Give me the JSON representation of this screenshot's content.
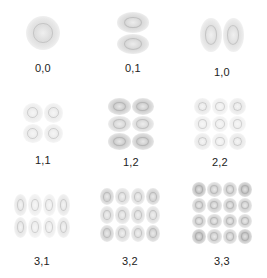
{
  "figure": {
    "panels": [
      {
        "label": "0,0",
        "nx": 1,
        "ny": 1,
        "cx": 43,
        "cy": 33,
        "w": 34,
        "h": 34,
        "intensity": 0.3
      },
      {
        "label": "0,1",
        "nx": 1,
        "ny": 2,
        "cx": 133,
        "cy": 33,
        "w": 32,
        "h": 42,
        "intensity": 0.35
      },
      {
        "label": "1,0",
        "nx": 2,
        "ny": 1,
        "cx": 222,
        "cy": 35,
        "w": 44,
        "h": 34,
        "intensity": 0.28
      },
      {
        "label": "1,1",
        "nx": 2,
        "ny": 2,
        "cx": 43,
        "cy": 123,
        "w": 40,
        "h": 40,
        "intensity": 0.18
      },
      {
        "label": "1,2",
        "nx": 2,
        "ny": 3,
        "cx": 131,
        "cy": 124,
        "w": 46,
        "h": 52,
        "intensity": 0.45
      },
      {
        "label": "2,2",
        "nx": 3,
        "ny": 3,
        "cx": 220,
        "cy": 124,
        "w": 52,
        "h": 52,
        "intensity": 0.2
      },
      {
        "label": "3,1",
        "nx": 4,
        "ny": 2,
        "cx": 42,
        "cy": 216,
        "w": 56,
        "h": 44,
        "intensity": 0.22
      },
      {
        "label": "3,2",
        "nx": 4,
        "ny": 3,
        "cx": 130,
        "cy": 215,
        "w": 60,
        "h": 54,
        "intensity": 0.4
      },
      {
        "label": "3,3",
        "nx": 4,
        "ny": 4,
        "cx": 222,
        "cy": 213,
        "w": 60,
        "h": 62,
        "intensity": 0.55
      }
    ],
    "label_offset_y": 35
  }
}
